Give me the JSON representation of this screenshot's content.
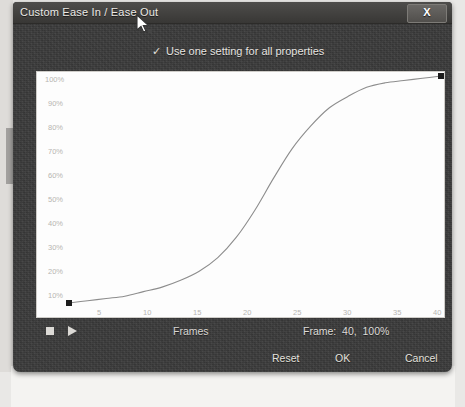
{
  "window": {
    "title": "Custom Ease In / Ease Out",
    "close_label": "X",
    "close_icon": "close-icon"
  },
  "options": {
    "use_one_setting": {
      "label": "Use one setting for all properties",
      "checked": true,
      "check_glyph": "✓"
    }
  },
  "transport": {
    "stop_icon": "stop-icon",
    "play_icon": "play-icon",
    "frames_label": "Frames",
    "frame_status": "Frame:  40,  100%"
  },
  "buttons": {
    "reset": "Reset",
    "ok": "OK",
    "cancel": "Cancel"
  },
  "colors": {
    "dialog_background": "#3a3a3a",
    "titlebar_background": "#42413f",
    "graph_background": "#fdfdfd",
    "curve_stroke": "#8a8a8a",
    "handle_fill": "#1c1c1c",
    "label_text": "#e6e4e0",
    "axis_text": "#b9b7b3"
  },
  "chart_data": {
    "type": "line",
    "title": "",
    "xlabel": "Frames",
    "ylabel": "",
    "xlim": [
      0,
      40
    ],
    "ylim": [
      0,
      100
    ],
    "grid": false,
    "legend": "none",
    "x_ticks": [
      5,
      10,
      15,
      20,
      25,
      30,
      35,
      40
    ],
    "y_ticks": [
      "10%",
      "20%",
      "30%",
      "40%",
      "50%",
      "60%",
      "70%",
      "80%",
      "90%",
      "100%"
    ],
    "y_tick_values": [
      10,
      20,
      30,
      40,
      50,
      60,
      70,
      80,
      90,
      100
    ],
    "series": [
      {
        "name": "Custom ease curve",
        "x": [
          0,
          2,
          4,
          6,
          8,
          10,
          12,
          14,
          16,
          18,
          20,
          22,
          24,
          26,
          28,
          30,
          32,
          34,
          36,
          38,
          40
        ],
        "values": [
          0,
          1,
          2,
          3,
          5,
          7,
          10,
          14,
          20,
          29,
          41,
          55,
          68,
          78,
          86,
          91,
          95,
          97,
          98,
          99,
          100
        ]
      }
    ],
    "control_points": [
      {
        "name": "start-handle",
        "x": 0,
        "y": 0
      },
      {
        "name": "end-handle",
        "x": 40,
        "y": 100
      }
    ],
    "cursor_marker": {
      "name": "mouse-pointer",
      "x": 10,
      "y": 99
    }
  }
}
